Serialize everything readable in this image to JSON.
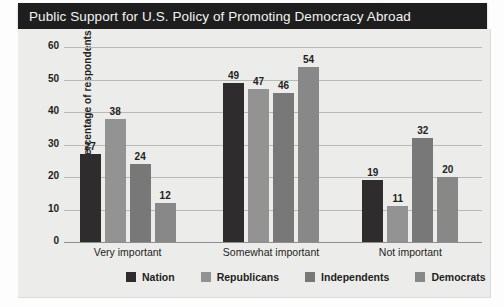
{
  "header": {
    "title": "Public Support for U.S. Policy of Promoting Democracy Abroad"
  },
  "chart_data": {
    "type": "bar",
    "title": "Public Support for U.S. Policy of Promoting Democracy Abroad",
    "xlabel": "",
    "ylabel": "Percentage of respondents",
    "ylim": [
      0,
      60
    ],
    "yticks": [
      "0",
      "10",
      "20",
      "30",
      "40",
      "50",
      "60"
    ],
    "grid": true,
    "legend_position": "bottom",
    "categories": [
      "Very important",
      "Somewhat important",
      "Not important"
    ],
    "series": [
      {
        "name": "Nation",
        "color": "#2e2c2d",
        "values": [
          27,
          49,
          19
        ]
      },
      {
        "name": "Republicans",
        "color": "#939393",
        "values": [
          38,
          47,
          11
        ]
      },
      {
        "name": "Independents",
        "color": "#787878",
        "values": [
          24,
          46,
          32
        ]
      },
      {
        "name": "Democrats",
        "color": "#888888",
        "values": [
          12,
          54,
          20
        ]
      }
    ]
  }
}
